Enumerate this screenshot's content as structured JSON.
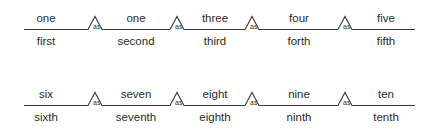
{
  "diagram": {
    "line_color": "#3a3a3a",
    "text_color": "#2b2b2b",
    "background_color": "#ffffff",
    "connector_label": "as",
    "rows": [
      {
        "name": "row-one-to-five",
        "segments": [
          {
            "cardinal": "one",
            "ordinal": "first"
          },
          {
            "cardinal": "one",
            "ordinal": "second"
          },
          {
            "cardinal": "three",
            "ordinal": "third"
          },
          {
            "cardinal": "four",
            "ordinal": "forth"
          },
          {
            "cardinal": "five",
            "ordinal": "fifth"
          }
        ],
        "connectors": [
          "as",
          "as",
          "as",
          "as"
        ]
      },
      {
        "name": "row-six-to-ten",
        "segments": [
          {
            "cardinal": "six",
            "ordinal": "sixth"
          },
          {
            "cardinal": "seven",
            "ordinal": "seventh"
          },
          {
            "cardinal": "eight",
            "ordinal": "eighth"
          },
          {
            "cardinal": "nine",
            "ordinal": "ninth"
          },
          {
            "cardinal": "ten",
            "ordinal": "tenth"
          }
        ],
        "connectors": [
          "as",
          "as",
          "as",
          "as"
        ]
      }
    ]
  }
}
